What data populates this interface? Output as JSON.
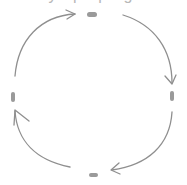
{
  "diagram": {
    "type": "cycle",
    "direction": "clockwise",
    "title_partial": "y p p g",
    "colors": {
      "node": "#9a9a9a",
      "edge": "#8f8f8f",
      "background": "#ffffff"
    },
    "nodes": [
      {
        "id": "top",
        "label": ""
      },
      {
        "id": "right",
        "label": ""
      },
      {
        "id": "bottom",
        "label": ""
      },
      {
        "id": "left",
        "label": ""
      }
    ],
    "edges": [
      {
        "from": "left",
        "to": "top"
      },
      {
        "from": "top",
        "to": "right"
      },
      {
        "from": "right",
        "to": "bottom"
      },
      {
        "from": "bottom",
        "to": "left"
      }
    ]
  }
}
